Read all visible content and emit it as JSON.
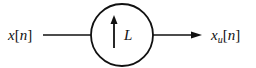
{
  "diagram": {
    "type": "block-diagram",
    "input": {
      "label_var": "x",
      "label_index": "n"
    },
    "block": {
      "label": "L",
      "shape": "circle",
      "symbol": "up-arrow",
      "description": "upsampler by factor L"
    },
    "output": {
      "label_var": "x",
      "label_sub": "u",
      "label_index": "n"
    },
    "colors": {
      "stroke": "#111111",
      "background": "#ffffff"
    }
  }
}
